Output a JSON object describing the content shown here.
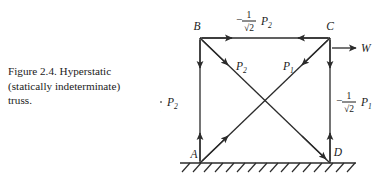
{
  "caption": {
    "lines": [
      "Figure 2.4.  Hyperstatic",
      "(statically indeterminate)",
      "truss."
    ]
  },
  "diagram": {
    "type": "truss-free-body-diagram",
    "nodes": [
      {
        "id": "B",
        "label": "B",
        "position": "top-left"
      },
      {
        "id": "C",
        "label": "C",
        "position": "top-right"
      },
      {
        "id": "A",
        "label": "A",
        "position": "bottom-left"
      },
      {
        "id": "D",
        "label": "D",
        "position": "bottom-right"
      }
    ],
    "members": [
      {
        "id": "top",
        "from": "B",
        "to": "C",
        "force_label": "top_force"
      },
      {
        "id": "left",
        "from": "B",
        "to": "A",
        "force_label": "left_force"
      },
      {
        "id": "right",
        "from": "C",
        "to": "D",
        "force_label": "right_force"
      },
      {
        "id": "diagonal-2",
        "from": "B",
        "to": "D",
        "force_label": "P2"
      },
      {
        "id": "diagonal-1",
        "from": "A",
        "to": "C",
        "force_label": "P1"
      }
    ],
    "forces": {
      "top_force": {
        "sign": "−",
        "numerator": "1",
        "denominator": "√2",
        "symbol": "P",
        "subscript": "2"
      },
      "left_force": {
        "sign": "−",
        "numerator": "1",
        "denominator": "√2",
        "symbol": "P",
        "subscript": "2"
      },
      "right_force": {
        "sign": "−",
        "numerator": "1",
        "denominator": "√2",
        "symbol": "P",
        "subscript": "1"
      },
      "diagonal_2": {
        "symbol": "P",
        "subscript": "2"
      },
      "diagonal_1": {
        "symbol": "P",
        "subscript": "1"
      },
      "applied_load": {
        "symbol": "W",
        "direction": "right",
        "applied_at": "C"
      }
    },
    "support": {
      "type": "fixed-ground",
      "hatch_count": 15
    },
    "colors": {
      "line": "#2b2b2b",
      "text": "#1b1b1b",
      "background": "#ffffff"
    }
  }
}
